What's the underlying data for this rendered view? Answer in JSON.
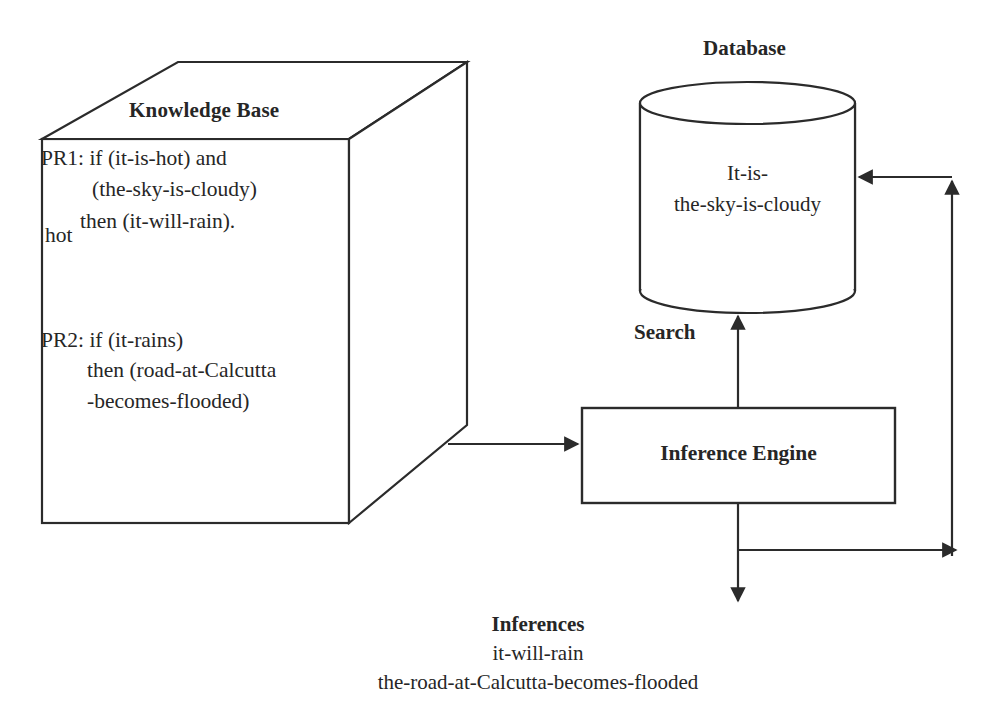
{
  "knowledge_base": {
    "title": "Knowledge Base",
    "rule1": {
      "line1": "PR1: if (it-is-hot) and",
      "line2": "(the-sky-is-cloudy)",
      "line3": "then (it-will-rain)."
    },
    "annotation": "hot",
    "rule2": {
      "line1": "PR2: if (it-rains)",
      "line2": "then (road-at-Calcutta",
      "line3": "-becomes-flooded)"
    }
  },
  "database": {
    "title": "Database",
    "fact_line1": "It-is-",
    "fact_line2": "the-sky-is-cloudy"
  },
  "inference_engine": {
    "label": "Inference Engine"
  },
  "edges": {
    "search_label": "Search"
  },
  "inferences": {
    "title": "Inferences",
    "items": [
      "it-will-rain",
      "the-road-at-Calcutta-becomes-flooded"
    ]
  },
  "colors": {
    "stroke": "#2b2b2b",
    "text": "#262626",
    "background": "#ffffff"
  }
}
